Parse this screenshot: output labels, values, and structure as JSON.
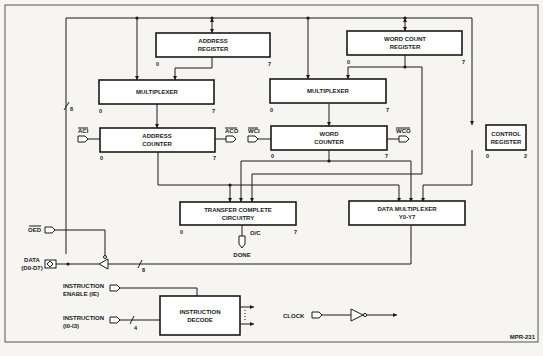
{
  "diagram": {
    "figure_id": "MPR-231",
    "blocks": {
      "address_register": {
        "line1": "ADDRESS",
        "line2": "REGISTER",
        "bit_low": "0",
        "bit_high": "7"
      },
      "word_count_register": {
        "line1": "WORD COUNT",
        "line2": "REGISTER",
        "bit_low": "0",
        "bit_high": "7"
      },
      "mux_left": {
        "label": "MULTIPLEXER",
        "bit_low": "0",
        "bit_high": "7"
      },
      "mux_right": {
        "label": "MULTIPLEXER",
        "bit_low": "0",
        "bit_high": "7"
      },
      "address_counter": {
        "line1": "ADDRESS",
        "line2": "COUNTER",
        "bit_low": "0",
        "bit_high": "7"
      },
      "word_counter": {
        "line1": "WORD",
        "line2": "COUNTER",
        "bit_low": "0",
        "bit_high": "7"
      },
      "control_register": {
        "line1": "CONTROL",
        "line2": "REGISTER",
        "bit_low": "0",
        "bit_high": "2"
      },
      "transfer_complete": {
        "line1": "TRANSFER COMPLETE",
        "line2": "CIRCUITRY",
        "bit_low": "0",
        "bit_high": "7",
        "output": "O/C"
      },
      "data_multiplexer": {
        "line1": "DATA MULTIPLEXER",
        "line2": "Y0-Y7"
      },
      "instruction_decode": {
        "line1": "INSTRUCTION",
        "line2": "DECODE"
      }
    },
    "signals": {
      "aci": "ACI",
      "aco": "ACO",
      "wci": "WCI",
      "wco": "WCO",
      "oed": "OED",
      "data_line1": "DATA",
      "data_line2": "(D0-D7)",
      "done": "DONE",
      "ie_line1": "INSTRUCTION",
      "ie_line2": "ENABLE (IE)",
      "instr_line1": "INSTRUCTION",
      "instr_line2": "(I0-I3)",
      "clock": "CLOCK"
    },
    "bus_widths": {
      "internal_bus": "8",
      "data_bus": "8",
      "instruction_bus": "4"
    }
  }
}
